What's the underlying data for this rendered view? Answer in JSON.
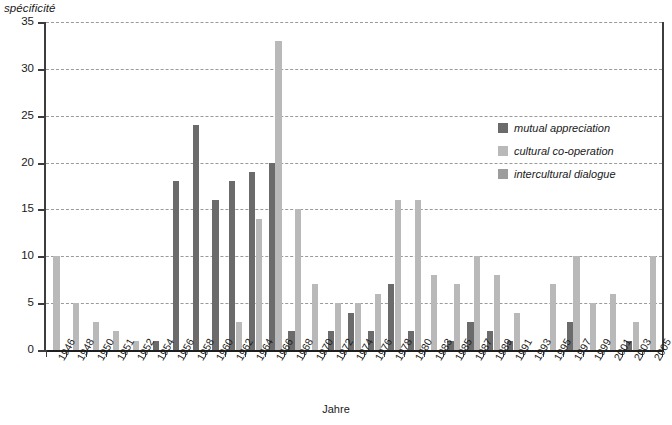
{
  "axis": {
    "y_title": "spécificité",
    "x_title": "Jahre"
  },
  "legend": {
    "items": [
      {
        "label": "mutual appreciation",
        "color": "#6b6b6b",
        "swatch_name": "legend-swatch-mutual-appreciation"
      },
      {
        "label": "cultural co-operation",
        "color": "#b9b9b9",
        "swatch_name": "legend-swatch-cultural-co-operation"
      },
      {
        "label": "intercultural dialogue",
        "color": "#9d9d9d",
        "swatch_name": "legend-swatch-intercultural-dialogue"
      }
    ]
  },
  "chart_data": {
    "type": "bar",
    "title": "",
    "subtitle": "",
    "xlabel": "Jahre",
    "ylabel": "spécificité",
    "ylim": [
      0,
      35
    ],
    "yticks": [
      0,
      5,
      10,
      15,
      20,
      25,
      30,
      35
    ],
    "grid": true,
    "grid_style": "dashed horizontal",
    "legend_position": "upper-right inside plot",
    "categories": [
      "1946",
      "1948",
      "1950",
      "1951",
      "1952",
      "1954",
      "1956",
      "1958",
      "1960",
      "1962",
      "1964",
      "1966",
      "1968",
      "1970",
      "1972",
      "1974",
      "1976",
      "1978",
      "1980",
      "1983",
      "1985",
      "1987",
      "1989",
      "1991",
      "1993",
      "1995",
      "1997",
      "1999",
      "2001",
      "2003",
      "2005"
    ],
    "series": [
      {
        "name": "mutual appreciation",
        "color": "#6b6b6b",
        "values": [
          0,
          0,
          0,
          0,
          0,
          1,
          18,
          24,
          16,
          18,
          19,
          20,
          2,
          0,
          2,
          4,
          2,
          7,
          2,
          0,
          1,
          3,
          2,
          1,
          0,
          0,
          3,
          0,
          0,
          1,
          0
        ]
      },
      {
        "name": "cultural co-operation",
        "color": "#b9b9b9",
        "values": [
          10,
          5,
          3,
          2,
          1,
          0,
          0,
          0,
          0,
          3,
          14,
          33,
          15,
          7,
          5,
          5,
          6,
          16,
          16,
          8,
          7,
          10,
          8,
          4,
          0,
          7,
          10,
          5,
          6,
          3,
          10
        ]
      },
      {
        "name": "intercultural dialogue",
        "color": "#9d9d9d",
        "values": [
          0,
          0,
          0,
          0,
          0,
          0,
          0,
          0,
          0,
          0,
          0,
          0,
          0,
          0,
          0,
          0,
          0,
          0,
          0,
          0,
          0,
          0,
          0,
          0,
          0,
          0,
          0,
          0,
          0,
          0,
          0
        ]
      }
    ]
  }
}
